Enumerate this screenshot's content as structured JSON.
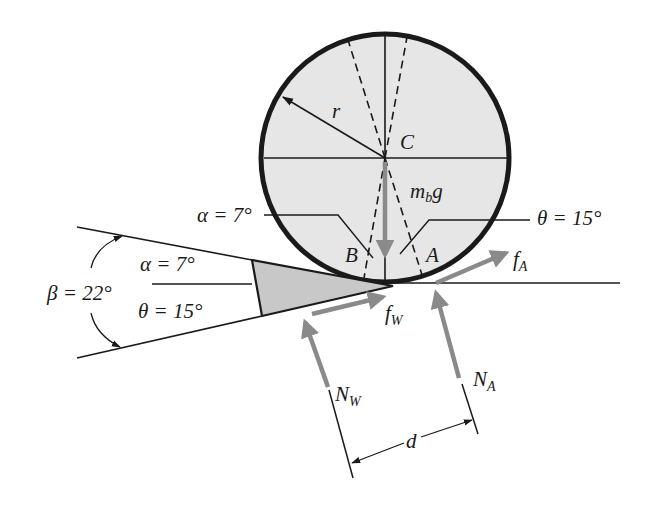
{
  "figure": {
    "colors": {
      "ink": "#1a1a1a",
      "force_arrow": "#8a8a8a",
      "ball_fill": "#e6e6e6",
      "wedge_fill": "#c8c8c8",
      "background": "#ffffff"
    }
  },
  "labels": {
    "radius": "r",
    "center": "C",
    "weight": {
      "main": "m",
      "sub": "b",
      "tail": "g"
    },
    "point_B": "B",
    "point_A": "A",
    "alpha_upper": "α = 7°",
    "theta_upper": "θ = 15°",
    "alpha_wedge": "α = 7°",
    "theta_wedge": "θ = 15°",
    "beta": "β = 22°",
    "friction_A": {
      "main": "f",
      "sub": "A"
    },
    "friction_W": {
      "main": "f",
      "sub": "W"
    },
    "normal_W": {
      "main": "N",
      "sub": "W"
    },
    "normal_A": {
      "main": "N",
      "sub": "A"
    },
    "distance": "d"
  },
  "angles": {
    "alpha_deg": 7,
    "theta_deg": 15,
    "beta_deg": 22
  }
}
